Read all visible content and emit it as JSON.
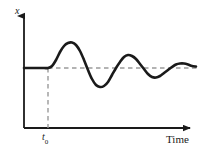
{
  "figure": {
    "title": "",
    "background_color": "#ffffff"
  },
  "labels": {
    "y_axis": "x",
    "x_axis": "Time",
    "t0_symbol": "t",
    "t0_subscript": "0"
  },
  "colors": {
    "curve": "#1a1a1a",
    "axis": "#1a1a1a",
    "dashed_guide": "#9a9a9a",
    "background": "#ffffff"
  },
  "chart_data": {
    "type": "line",
    "title": "",
    "subtitle": "",
    "xlabel": "Time",
    "ylabel": "x",
    "grid": false,
    "legend": null,
    "legend_position": "none",
    "xlim": [
      0,
      210
    ],
    "ylim": [
      0,
      152
    ],
    "annotations": [
      {
        "name": "step-time-marker",
        "label": "t0",
        "text": "t₀",
        "x": 48,
        "type": "vertical-dashed-line",
        "from_y": 68,
        "to_y": 128,
        "color": "#9a9a9a"
      },
      {
        "name": "steady-state-line",
        "label": "steady state level",
        "y": 68,
        "type": "horizontal-dashed-line",
        "from_x": 48,
        "to_x": 198,
        "color": "#9a9a9a"
      }
    ],
    "axes": {
      "y_axis": {
        "x": 24,
        "from_y": 128,
        "to_y": 14,
        "arrow": true
      },
      "x_axis": {
        "y": 128,
        "from_x": 24,
        "to_x": 196,
        "arrow": true
      }
    },
    "series": [
      {
        "name": "damped-step-response",
        "description": "Flat pre-step baseline then decaying oscillation settling to steady state",
        "color": "#1a1a1a",
        "line_width": 2.6,
        "points": [
          [
            24,
            68
          ],
          [
            34,
            68
          ],
          [
            44,
            68
          ],
          [
            48,
            68
          ],
          [
            52,
            66
          ],
          [
            56,
            60
          ],
          [
            60,
            52
          ],
          [
            64,
            46
          ],
          [
            68,
            43
          ],
          [
            72,
            42.5
          ],
          [
            76,
            45
          ],
          [
            80,
            51
          ],
          [
            84,
            60
          ],
          [
            88,
            70
          ],
          [
            92,
            79
          ],
          [
            96,
            85
          ],
          [
            100,
            87
          ],
          [
            104,
            86
          ],
          [
            108,
            82
          ],
          [
            112,
            75
          ],
          [
            116,
            68
          ],
          [
            120,
            62
          ],
          [
            124,
            57
          ],
          [
            128,
            55
          ],
          [
            132,
            56
          ],
          [
            136,
            59
          ],
          [
            140,
            64
          ],
          [
            144,
            69
          ],
          [
            148,
            74
          ],
          [
            152,
            77
          ],
          [
            156,
            77.5
          ],
          [
            160,
            76
          ],
          [
            164,
            73
          ],
          [
            168,
            70
          ],
          [
            172,
            67
          ],
          [
            176,
            64.5
          ],
          [
            180,
            63.5
          ],
          [
            184,
            63.5
          ],
          [
            188,
            64.5
          ],
          [
            192,
            66
          ],
          [
            196,
            66.5
          ]
        ]
      }
    ]
  }
}
